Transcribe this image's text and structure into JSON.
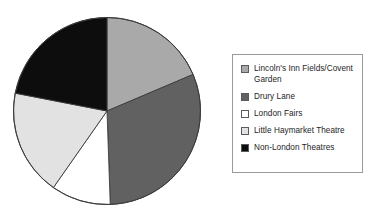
{
  "chart_data": {
    "type": "pie",
    "title": "",
    "subtitle": "",
    "xlabel": "",
    "ylabel": "",
    "grid": false,
    "legend_position": "right",
    "start_angle_deg": 0,
    "direction": "clockwise",
    "categories": [
      "Lincoln's Inn Fields/Covent Garden",
      "Drury Lane",
      "London Fairs",
      "Little Haymarket Theatre",
      "Non-London Theatres"
    ],
    "values": [
      18.6,
      30.8,
      10.3,
      18.3,
      22.0
    ],
    "units": "percent",
    "colors": [
      "#a9a9a9",
      "#616161",
      "#ffffff",
      "#e2e2e2",
      "#0d0d0d"
    ],
    "slice_angles_deg": [
      67,
      111,
      37,
      66,
      79
    ],
    "slice_boundaries_deg": [
      0,
      67,
      178,
      215,
      281,
      360
    ],
    "annotations": []
  },
  "pie": {
    "name": "pie-chart",
    "outline_color": "#3c3c3c",
    "slices": [
      {
        "label": "Lincoln's Inn Fields/Covent Garden",
        "color": "#a9a9a9",
        "start": 0,
        "end": 67
      },
      {
        "label": "Drury Lane",
        "color": "#616161",
        "start": 67,
        "end": 178
      },
      {
        "label": "London Fairs",
        "color": "#ffffff",
        "start": 178,
        "end": 215
      },
      {
        "label": "Little Haymarket Theatre",
        "color": "#e2e2e2",
        "start": 215,
        "end": 281
      },
      {
        "label": "Non-London Theatres",
        "color": "#0d0d0d",
        "start": 281,
        "end": 360
      }
    ]
  },
  "legend": {
    "border_color": "#9a9a9a",
    "items": [
      {
        "swatch_name": "legend-swatch-lincolns-inn-fields",
        "color": "#a9a9a9",
        "label": "Lincoln's Inn Fields/Covent\nGarden"
      },
      {
        "swatch_name": "legend-swatch-drury-lane",
        "color": "#616161",
        "label": "Drury Lane"
      },
      {
        "swatch_name": "legend-swatch-london-fairs",
        "color": "#ffffff",
        "label": "London Fairs"
      },
      {
        "swatch_name": "legend-swatch-little-haymarket",
        "color": "#e2e2e2",
        "label": "Little Haymarket Theatre"
      },
      {
        "swatch_name": "legend-swatch-non-london",
        "color": "#0d0d0d",
        "label": "Non-London Theatres"
      }
    ]
  }
}
